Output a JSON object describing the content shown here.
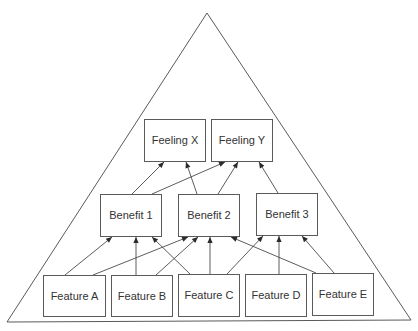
{
  "diagram": {
    "type": "hierarchy-triangle",
    "colors": {
      "stroke": "#5a5a5a",
      "text": "#333333",
      "background": "#ffffff"
    },
    "triangle": {
      "apex": [
        207,
        13
      ],
      "bottom_left": [
        7,
        322
      ],
      "bottom_right": [
        411,
        320
      ]
    },
    "levels": [
      {
        "name": "feelings",
        "nodes": [
          {
            "id": "feeling_x",
            "label": "Feeling X",
            "x": 144,
            "y": 119,
            "w": 61,
            "h": 42
          },
          {
            "id": "feeling_y",
            "label": "Feeling Y",
            "x": 211,
            "y": 119,
            "w": 61,
            "h": 42
          }
        ]
      },
      {
        "name": "benefits",
        "nodes": [
          {
            "id": "benefit_1",
            "label": "Benefit 1",
            "x": 100,
            "y": 194,
            "w": 61,
            "h": 42
          },
          {
            "id": "benefit_2",
            "label": "Benefit 2",
            "x": 178,
            "y": 194,
            "w": 61,
            "h": 42
          },
          {
            "id": "benefit_3",
            "label": "Benefit 3",
            "x": 256,
            "y": 193,
            "w": 61,
            "h": 42
          }
        ]
      },
      {
        "name": "features",
        "nodes": [
          {
            "id": "feature_a",
            "label": "Feature A",
            "x": 43,
            "y": 275,
            "w": 62,
            "h": 41
          },
          {
            "id": "feature_b",
            "label": "Feature B",
            "x": 111,
            "y": 275,
            "w": 61,
            "h": 41
          },
          {
            "id": "feature_c",
            "label": "Feature C",
            "x": 178,
            "y": 274,
            "w": 61,
            "h": 42
          },
          {
            "id": "feature_d",
            "label": "Feature D",
            "x": 245,
            "y": 274,
            "w": 61,
            "h": 42
          },
          {
            "id": "feature_e",
            "label": "Feature E",
            "x": 312,
            "y": 273,
            "w": 61,
            "h": 42
          }
        ]
      }
    ],
    "edges": [
      {
        "from": "feature_a",
        "to": "benefit_1",
        "x1": 65,
        "y1": 275,
        "x2": 112,
        "y2": 237
      },
      {
        "from": "feature_a",
        "to": "benefit_2",
        "x1": 93,
        "y1": 275,
        "x2": 188,
        "y2": 237
      },
      {
        "from": "feature_b",
        "to": "benefit_1",
        "x1": 136,
        "y1": 275,
        "x2": 136,
        "y2": 237
      },
      {
        "from": "feature_b",
        "to": "benefit_2",
        "x1": 156,
        "y1": 275,
        "x2": 198,
        "y2": 237
      },
      {
        "from": "feature_c",
        "to": "benefit_1",
        "x1": 190,
        "y1": 274,
        "x2": 152,
        "y2": 237
      },
      {
        "from": "feature_c",
        "to": "benefit_2",
        "x1": 210,
        "y1": 274,
        "x2": 210,
        "y2": 237
      },
      {
        "from": "feature_c",
        "to": "benefit_3",
        "x1": 227,
        "y1": 274,
        "x2": 263,
        "y2": 236
      },
      {
        "from": "feature_d",
        "to": "benefit_3",
        "x1": 279,
        "y1": 274,
        "x2": 279,
        "y2": 236
      },
      {
        "from": "feature_e",
        "to": "benefit_2",
        "x1": 316,
        "y1": 273,
        "x2": 231,
        "y2": 237
      },
      {
        "from": "feature_e",
        "to": "benefit_3",
        "x1": 334,
        "y1": 273,
        "x2": 302,
        "y2": 236
      },
      {
        "from": "benefit_1",
        "to": "feeling_x",
        "x1": 132,
        "y1": 194,
        "x2": 164,
        "y2": 162
      },
      {
        "from": "benefit_1",
        "to": "feeling_y",
        "x1": 152,
        "y1": 194,
        "x2": 225,
        "y2": 162
      },
      {
        "from": "benefit_2",
        "to": "feeling_x",
        "x1": 197,
        "y1": 194,
        "x2": 186,
        "y2": 162
      },
      {
        "from": "benefit_2",
        "to": "feeling_y",
        "x1": 218,
        "y1": 194,
        "x2": 238,
        "y2": 162
      },
      {
        "from": "benefit_3",
        "to": "feeling_y",
        "x1": 278,
        "y1": 193,
        "x2": 259,
        "y2": 162
      }
    ]
  }
}
